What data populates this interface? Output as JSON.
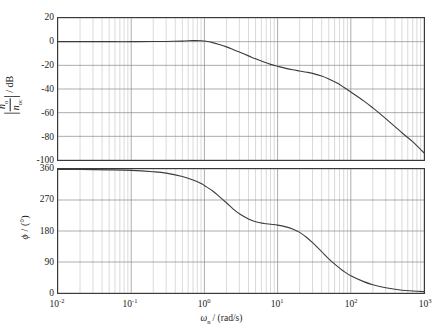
{
  "figure": {
    "type": "bode-plot",
    "background": "#ffffff",
    "curve_color": "#3c3c3c",
    "grid_color": "#9a9a9a",
    "axis_color": "#3a3a3a"
  },
  "xaxis": {
    "label_symbol": "ω",
    "label_subscript": "n",
    "label_units": "/ (rad/s)",
    "label_full": "ωn / (rad/s)",
    "scale": "log",
    "min": 0.01,
    "max": 1000,
    "decade_exponents": [
      -2,
      -1,
      0,
      1,
      2,
      3
    ],
    "tick_labels": [
      "10⁻²",
      "10⁻¹",
      "10⁰",
      "10¹",
      "10²",
      "10³"
    ],
    "tick_mantissa": "10",
    "tick_exponents": [
      "-2",
      "-1",
      "0",
      "1",
      "2",
      "3"
    ],
    "minor_gridlines": true
  },
  "magnitude_plot": {
    "ylabel_numerator": "n",
    "ylabel_numerator_sub": "o",
    "ylabel_denominator": "n",
    "ylabel_denominator_sub": "oc",
    "ylabel_units": "/ dB",
    "ylabel_full": "|no/noc| / dB",
    "ymin": -100,
    "ymax": 20,
    "ystep": 20,
    "ytick_labels": [
      "20",
      "0",
      "-20",
      "-40",
      "-60",
      "-80",
      "-100"
    ],
    "ytick_values": [
      20,
      0,
      -20,
      -40,
      -60,
      -80,
      -100
    ]
  },
  "phase_plot": {
    "ylabel_symbol": "φ",
    "ylabel_units": "/ (°)",
    "ylabel_full": "φ / (°)",
    "ymin": 0,
    "ymax": 360,
    "ystep": 90,
    "ytick_labels": [
      "360",
      "270",
      "180",
      "90",
      "0"
    ],
    "ytick_values": [
      360,
      270,
      180,
      90,
      0
    ]
  },
  "chart_data": {
    "type": "line",
    "title": "",
    "xlabel": "ωn / (rad/s)",
    "xscale": "log",
    "xlim": [
      0.01,
      1000
    ],
    "grid": true,
    "legend": "none",
    "subplots": [
      {
        "name": "magnitude",
        "ylabel": "|no/noc| / dB",
        "ylim": [
          -100,
          20
        ],
        "yticks": [
          20,
          0,
          -20,
          -40,
          -60,
          -80,
          -100
        ],
        "series": [
          {
            "name": "magnitude-response",
            "x": [
              0.01,
              0.02,
              0.05,
              0.1,
              0.2,
              0.3,
              0.5,
              0.7,
              0.9,
              1.0,
              1.3,
              1.6,
              2.0,
              2.5,
              3.0,
              4.0,
              5.0,
              6.5,
              8.0,
              10.0,
              13.0,
              16.0,
              20.0,
              25.0,
              30.0,
              40.0,
              50.0,
              65.0,
              80.0,
              100.0,
              150.0,
              200.0,
              300.0,
              500.0,
              700.0,
              1000.0
            ],
            "y": [
              0.0,
              0.0,
              0.0,
              0.0,
              0.1,
              0.2,
              0.5,
              0.9,
              0.8,
              0.5,
              -0.8,
              -2.4,
              -4.4,
              -6.8,
              -8.8,
              -12.0,
              -14.5,
              -17.2,
              -19.2,
              -20.8,
              -22.6,
              -23.8,
              -24.8,
              -25.8,
              -26.8,
              -29.0,
              -31.5,
              -35.0,
              -38.5,
              -42.5,
              -50.0,
              -56.0,
              -65.0,
              -77.0,
              -84.5,
              -94.0
            ]
          }
        ]
      },
      {
        "name": "phase",
        "ylabel": "φ / (°)",
        "ylim": [
          0,
          360
        ],
        "yticks": [
          0,
          90,
          180,
          270,
          360
        ],
        "series": [
          {
            "name": "phase-response",
            "x": [
              0.01,
              0.02,
              0.05,
              0.1,
              0.2,
              0.3,
              0.5,
              0.7,
              0.9,
              1.0,
              1.3,
              1.6,
              2.0,
              2.5,
              3.0,
              4.0,
              5.0,
              6.5,
              8.0,
              10.0,
              13.0,
              16.0,
              20.0,
              25.0,
              30.0,
              40.0,
              50.0,
              65.0,
              80.0,
              100.0,
              150.0,
              200.0,
              300.0,
              500.0,
              700.0,
              1000.0
            ],
            "y": [
              359.0,
              358.5,
              357.5,
              356.0,
              352.0,
              348.0,
              338.0,
              328.0,
              318.0,
              312.0,
              296.0,
              280.0,
              262.0,
              243.0,
              230.0,
              215.0,
              207.0,
              202.0,
              199.5,
              197.0,
              192.0,
              186.0,
              176.0,
              161.0,
              146.0,
              120.0,
              99.0,
              78.0,
              63.0,
              50.0,
              33.0,
              24.0,
              15.0,
              8.0,
              6.0,
              4.0
            ]
          }
        ]
      }
    ]
  }
}
